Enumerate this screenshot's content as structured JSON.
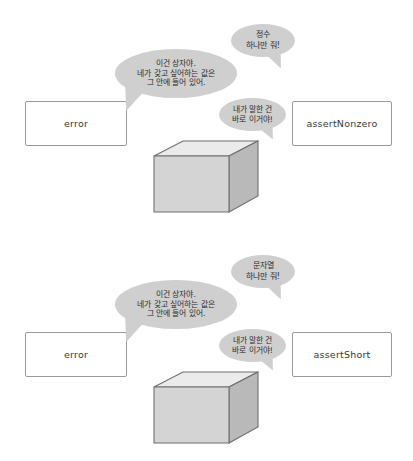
{
  "page": {
    "background_color": "#ffffff",
    "bubble_fill_color": "#cfcfcf",
    "box_front_color": "#d4d4d4",
    "box_top_color": "#ebebeb",
    "box_side_color": "#b9b9b9",
    "outline_color": "#9a9a9a"
  },
  "panels": [
    {
      "id": "integer-panel",
      "left_box_label": "error",
      "right_box_label": "assertNonzero",
      "bubbles": {
        "request": "정수\n하나만 줘!",
        "explain": "이건 상자야.\n네가 갖고 싶어하는 값은\n그 안에 들어 있어.",
        "point": "내가 말한 건\n바로 이거야!"
      },
      "box_shape": "cube"
    },
    {
      "id": "string-panel",
      "left_box_label": "error",
      "right_box_label": "assertShort",
      "bubbles": {
        "request": "문자열\n하나만 줘!",
        "explain": "이건 상자야.\n네가 갖고 싶어하는 값은\n그 안에 들어 있어.",
        "point": "내가 말한 건\n바로 이거야!"
      },
      "box_shape": "cube"
    }
  ]
}
